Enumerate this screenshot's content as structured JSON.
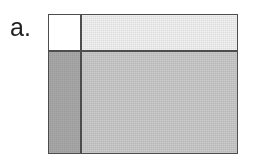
{
  "figure": {
    "panel_label": "a.",
    "background_color": "#ffffff",
    "border_color": "#4a4a4a",
    "box": {
      "x": 48,
      "y": 14,
      "width": 190,
      "height": 140
    },
    "divider": {
      "horizontal_y": 35,
      "vertical_x": 31,
      "color": "#4a4a4a"
    },
    "regions": [
      {
        "name": "top-left",
        "fill_color": "#ffffff",
        "shade": "white",
        "dithered": false
      },
      {
        "name": "top-right",
        "fill_color": "#f2f2f2",
        "shade": "very light gray",
        "dithered": true
      },
      {
        "name": "bottom-left",
        "fill_color": "#a8a8a8",
        "shade": "dark gray",
        "dithered": true
      },
      {
        "name": "bottom-right",
        "fill_color": "#c9c9c9",
        "shade": "medium gray",
        "dithered": true
      }
    ]
  }
}
